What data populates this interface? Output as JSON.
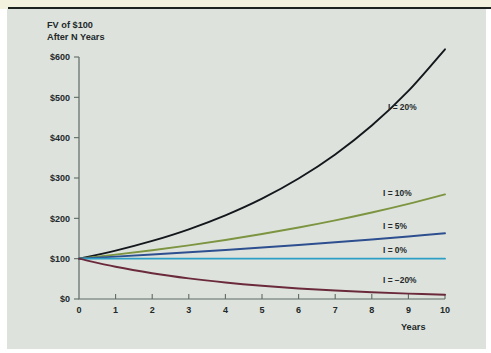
{
  "figure": {
    "background_color": "#dde3dc",
    "top_strip_color": "#f3f2de",
    "rule_color": "#1d2420"
  },
  "chart_data": {
    "type": "line",
    "title": "",
    "title_lines": [
      "FV of $100",
      "After N Years"
    ],
    "xlabel": "Years",
    "ylabel": "",
    "x": [
      0,
      1,
      2,
      3,
      4,
      5,
      6,
      7,
      8,
      9,
      10
    ],
    "xlim": [
      0,
      10
    ],
    "ylim": [
      0,
      600
    ],
    "xticks": [
      "0",
      "1",
      "2",
      "3",
      "4",
      "5",
      "6",
      "7",
      "8",
      "9",
      "10"
    ],
    "yticks": [
      "$0",
      "$100",
      "$200",
      "$300",
      "$400",
      "$500",
      "$600"
    ],
    "ytick_values": [
      0,
      100,
      200,
      300,
      400,
      500,
      600
    ],
    "grid": false,
    "legend_position": "inline-right-of-curve-ends",
    "series": [
      {
        "name": "I = 20%",
        "rate": 0.2,
        "color": "#14171c",
        "values": [
          100,
          120,
          144,
          172.8,
          207.4,
          248.8,
          298.6,
          358.3,
          430,
          516,
          619.2
        ]
      },
      {
        "name": "I = 10%",
        "rate": 0.1,
        "color": "#7d9440",
        "values": [
          100,
          110,
          121,
          133.1,
          146.4,
          161.1,
          177.2,
          194.9,
          214.4,
          235.8,
          259.4
        ]
      },
      {
        "name": "I = 5%",
        "rate": 0.05,
        "color": "#2e4f8f",
        "values": [
          100,
          105,
          110.3,
          115.8,
          121.6,
          127.6,
          134,
          140.7,
          147.7,
          155.1,
          162.9
        ]
      },
      {
        "name": "I = 0%",
        "rate": 0.0,
        "color": "#2d9ec4",
        "values": [
          100,
          100,
          100,
          100,
          100,
          100,
          100,
          100,
          100,
          100,
          100
        ]
      },
      {
        "name": "I = −20%",
        "rate": -0.2,
        "color": "#6b2a3c",
        "values": [
          100,
          80,
          64,
          51.2,
          41,
          32.8,
          26.2,
          21,
          16.8,
          13.4,
          10.7
        ]
      }
    ]
  }
}
